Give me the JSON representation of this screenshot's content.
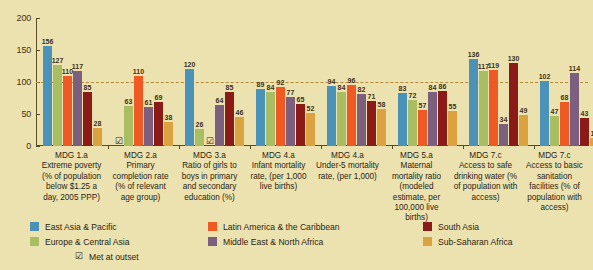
{
  "chart_data": {
    "type": "bar",
    "title": "",
    "xlabel": "",
    "ylabel": "",
    "ylim": [
      0,
      200
    ],
    "yticks": [
      0,
      50,
      100,
      150,
      200
    ],
    "grid": false,
    "reference_line": 100,
    "legend_position": "bottom",
    "annotation_note": "Met at outset",
    "categories": [
      "MDG 1.a Extreme poverty (% of population below $1.25 a day, 2005 PPP)",
      "MDG 2.a Primary completion rate (% of relevant age group)",
      "MDG 3.a Ratio of girls to boys in primary and secondary education (%)",
      "MDG 4.a Infant mortality rate, (per 1,000 live births)",
      "MDG 4.a Under-5 mortality rate, (per 1,000)",
      "MDG 5.a Maternal mortality ratio (modeled estimate, per 100,000 live births)",
      "MDG 7.c Access to safe drinking water (% of population with access)",
      "MDG 7.c Access to basic sanitation facilities (% of population with access)"
    ],
    "series": [
      {
        "name": "East Asia & Pacific",
        "color": "#4b92b9",
        "values": [
          156,
          null,
          120,
          89,
          94,
          83,
          136,
          102
        ]
      },
      {
        "name": "Europe & Central Asia",
        "color": "#a9bd62",
        "values": [
          127,
          63,
          26,
          84,
          84,
          72,
          117,
          47
        ]
      },
      {
        "name": "Latin America & the Caribbean",
        "color": "#ef5a24",
        "values": [
          110,
          110,
          null,
          92,
          96,
          57,
          119,
          68
        ]
      },
      {
        "name": "Middle East & North Africa",
        "color": "#7c5f7e",
        "values": [
          117,
          61,
          64,
          77,
          82,
          84,
          34,
          114
        ]
      },
      {
        "name": "South Asia",
        "color": "#8a1b17",
        "values": [
          85,
          69,
          85,
          65,
          71,
          86,
          130,
          43
        ]
      },
      {
        "name": "Sub-Saharan Africa",
        "color": "#dba33f",
        "values": [
          28,
          38,
          46,
          52,
          58,
          55,
          49,
          13
        ]
      }
    ],
    "met_at_outset": [
      {
        "group": 0,
        "series": null
      },
      {
        "group": 1,
        "series": 0
      },
      {
        "group": 2,
        "series": 2
      },
      {
        "group": 3,
        "series": null
      },
      {
        "group": 4,
        "series": null
      },
      {
        "group": 5,
        "series": null
      },
      {
        "group": 6,
        "series": null
      },
      {
        "group": 7,
        "series": null
      }
    ]
  },
  "axis": {
    "y_tick_labels": [
      "200",
      "150",
      "100",
      "50",
      "0"
    ]
  },
  "categories_display": [
    {
      "code": "MDG 1.a",
      "text": "Extreme poverty (% of population below $1.25 a day, 2005 PPP)"
    },
    {
      "code": "MDG 2.a",
      "text": "Primary completion rate (% of relevant age group)"
    },
    {
      "code": "MDG 3.a",
      "text": "Ratio of girls to boys in primary and secondary education (%)"
    },
    {
      "code": "MDG 4.a",
      "text": "Infant mortality rate, (per 1,000 live births)"
    },
    {
      "code": "MDG 4.a",
      "text": "Under-5 mortality rate, (per 1,000)"
    },
    {
      "code": "MDG 5.a",
      "text": "Maternal mortality ratio (modeled estimate, per 100,000 live births)"
    },
    {
      "code": "MDG 7.c",
      "text": "Access to safe drinking water (% of population with access)"
    },
    {
      "code": "MDG 7.c",
      "text": "Access to basic sanitation facilities (% of population with access)"
    }
  ],
  "legend": {
    "items": [
      {
        "label": "East Asia & Pacific",
        "color": "#4b92b9"
      },
      {
        "label": "Latin America & the Caribbean",
        "color": "#ef5a24"
      },
      {
        "label": "South Asia",
        "color": "#8a1b17"
      },
      {
        "label": "Europe & Central Asia",
        "color": "#a9bd62"
      },
      {
        "label": "Middle East & North Africa",
        "color": "#7c5f7e"
      },
      {
        "label": "Sub-Saharan Africa",
        "color": "#dba33f"
      }
    ],
    "met_label": "Met at outset",
    "met_glyph": "☑"
  },
  "colors": {
    "background": "#ece2b0",
    "axis": "#5a4a22",
    "reference_line": "#b08a3a",
    "text": "#2b2410"
  }
}
